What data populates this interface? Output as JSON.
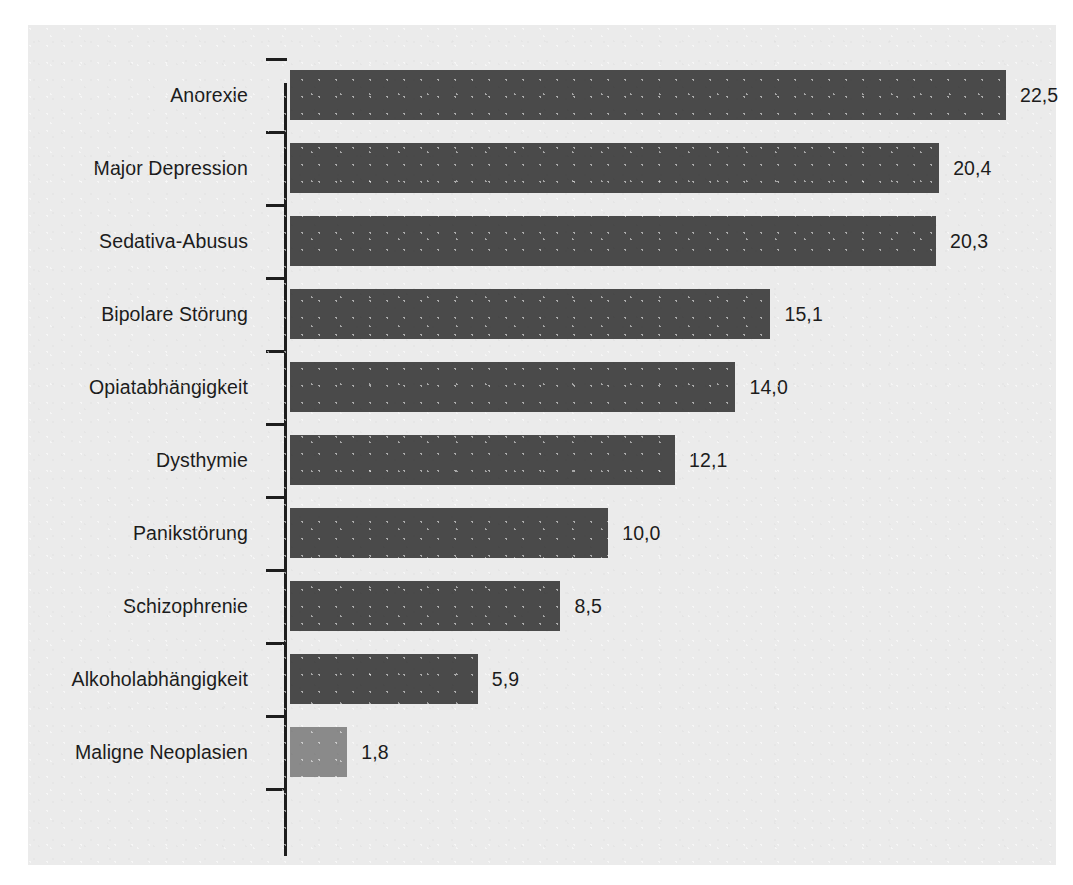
{
  "chart_data": {
    "type": "bar",
    "orientation": "horizontal",
    "title": "",
    "subtitle": "",
    "xlabel": "",
    "ylabel": "",
    "grid": false,
    "legend": null,
    "xlim": [
      0,
      22.5
    ],
    "categories": [
      "Anorexie",
      "Major Depression",
      "Sedativa-Abusus",
      "Bipolare Störung",
      "Opiatabhängigkeit",
      "Dysthymie",
      "Panikstörung",
      "Schizophrenie",
      "Alkoholabhängigkeit",
      "Maligne Neoplasien"
    ],
    "values": [
      22.5,
      20.4,
      20.3,
      15.1,
      14.0,
      12.1,
      10.0,
      8.5,
      5.9,
      1.8
    ],
    "value_labels": [
      "22,5",
      "20,4",
      "20,3",
      "15,1",
      "14,0",
      "12,1",
      "10,0",
      "8,5",
      "5,9",
      "1,8"
    ],
    "bar_colors": [
      "#4a4a4a",
      "#4a4a4a",
      "#4a4a4a",
      "#4a4a4a",
      "#4a4a4a",
      "#4a4a4a",
      "#4a4a4a",
      "#4a4a4a",
      "#4a4a4a",
      "#8a8a8a"
    ],
    "accent_color": "#4a4a4a",
    "highlight_color": "#8a8a8a",
    "background_color": "#ebebeb",
    "axis_color": "#1d1d1d"
  }
}
